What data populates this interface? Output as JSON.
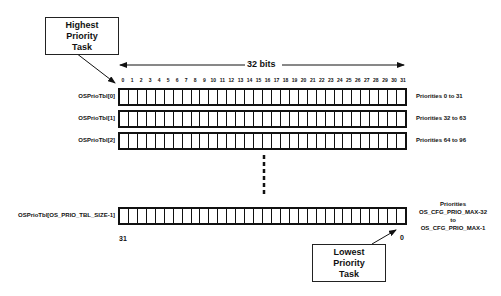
{
  "diagram": {
    "width_label": "32 bits",
    "highest_callout": [
      "Highest",
      "Priority",
      "Task"
    ],
    "lowest_callout": [
      "Lowest",
      "Priority",
      "Task"
    ],
    "bit_numbers": [
      "0",
      "1",
      "2",
      "3",
      "4",
      "5",
      "6",
      "7",
      "8",
      "9",
      "10",
      "11",
      "12",
      "13",
      "14",
      "15",
      "16",
      "17",
      "18",
      "19",
      "20",
      "21",
      "22",
      "23",
      "24",
      "25",
      "26",
      "27",
      "28",
      "29",
      "30",
      "31"
    ],
    "rows": [
      {
        "label": "OSPrioTbl[0]",
        "priorities": "Priorities 0 to 31"
      },
      {
        "label": "OSPrioTbl[1]",
        "priorities": "Priorities 32 to 63"
      },
      {
        "label": "OSPrioTbl[2]",
        "priorities": "Priorities 64 to 96"
      }
    ],
    "last_row": {
      "label": "OSPrioTbl[OS_PRIO_TBL_SIZE-1]",
      "priorities_lines": [
        "Priorities",
        "OS_CFG_PRIO_MAX-32",
        "to",
        "OS_CFG_PRIO_MAX-1"
      ],
      "left_bit": "31",
      "right_bit": "0"
    },
    "bits_per_row": 32,
    "line_color": "#111111"
  }
}
